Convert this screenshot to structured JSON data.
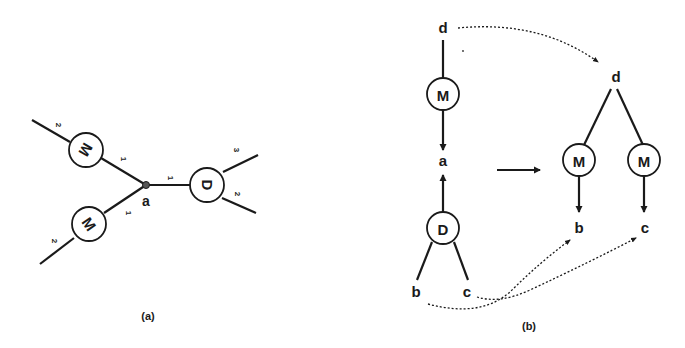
{
  "colors": {
    "ink": "#1a1a1a",
    "background": "#ffffff"
  },
  "panel_a": {
    "caption": "(a)",
    "junction_label": "a",
    "nodes": {
      "m_top": {
        "label": "M"
      },
      "m_bottom": {
        "label": "M"
      },
      "d": {
        "label": "D"
      }
    },
    "port_labels": {
      "m_top_outer": "2",
      "m_top_inner": "1",
      "m_bottom_inner": "1",
      "m_bottom_outer": "2",
      "d_input": "1",
      "d_out_top": "3",
      "d_out_bottom": "2"
    }
  },
  "panel_b": {
    "caption": "(b)",
    "left": {
      "top_label": "d",
      "m_label": "M",
      "mid_label": "a",
      "d_label": "D",
      "leaf_left": "b",
      "leaf_right": "c"
    },
    "right": {
      "root_label": "d",
      "m_left_label": "M",
      "m_right_label": "M",
      "leaf_left": "b",
      "leaf_right": "c"
    }
  }
}
